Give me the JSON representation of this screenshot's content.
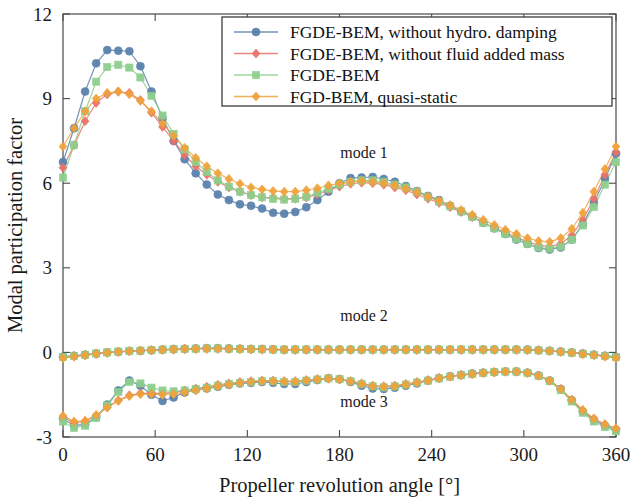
{
  "chart_data": {
    "type": "line",
    "title": "",
    "xlabel": "Propeller revolution angle [°]",
    "ylabel": "Modal participation factor",
    "xlim": [
      0,
      360
    ],
    "ylim": [
      -3,
      12
    ],
    "xticks": [
      0,
      60,
      120,
      180,
      240,
      300,
      360
    ],
    "yticks": [
      -3,
      0,
      3,
      6,
      9,
      12
    ],
    "xtick_labels": [
      "0",
      "60",
      "120",
      "180",
      "240",
      "300",
      "360"
    ],
    "ytick_labels": [
      "-3",
      "0",
      "3",
      "6",
      "9",
      "12"
    ],
    "grid": false,
    "legend_position": "top-right-inside",
    "annotations": [
      {
        "text": "mode 1",
        "x": 196,
        "y": 6.9
      },
      {
        "text": "mode 2",
        "x": 196,
        "y": 1.1
      },
      {
        "text": "mode 3",
        "x": 196,
        "y": -1.95
      }
    ],
    "x": [
      0,
      7.2,
      14.4,
      21.6,
      28.8,
      36,
      43.2,
      50.4,
      57.6,
      64.8,
      72,
      79.2,
      86.4,
      93.6,
      100.8,
      108,
      115.2,
      122.4,
      129.6,
      136.8,
      144,
      151.2,
      158.4,
      165.6,
      172.8,
      180,
      187.2,
      194.4,
      201.6,
      208.8,
      216,
      223.2,
      230.4,
      237.6,
      244.8,
      252,
      259.2,
      266.4,
      273.6,
      280.8,
      288,
      295.2,
      302.4,
      309.6,
      316.8,
      324,
      331.2,
      338.4,
      345.6,
      352.8,
      360
    ],
    "series": [
      {
        "name": "FGDE-BEM, without hydro. damping",
        "color": "#5b82ad",
        "marker": "circle",
        "mode": 1,
        "values": [
          6.75,
          7.95,
          9.25,
          10.25,
          10.72,
          10.7,
          10.68,
          10.15,
          9.25,
          8.3,
          7.5,
          6.85,
          6.35,
          5.95,
          5.6,
          5.4,
          5.25,
          5.2,
          5.1,
          4.95,
          4.92,
          4.98,
          5.15,
          5.4,
          5.7,
          6.0,
          6.18,
          6.2,
          6.22,
          6.15,
          6.05,
          5.9,
          5.72,
          5.55,
          5.4,
          5.2,
          5.0,
          4.82,
          4.6,
          4.4,
          4.2,
          4.0,
          3.85,
          3.7,
          3.65,
          3.72,
          4.0,
          4.55,
          5.3,
          6.15,
          7.05
        ]
      },
      {
        "name": "FGDE-BEM, without fluid added mass",
        "color": "#e8736a",
        "marker": "diamond",
        "mode": 1,
        "values": [
          6.55,
          7.35,
          8.2,
          8.85,
          9.15,
          9.25,
          9.2,
          8.95,
          8.5,
          8.0,
          7.5,
          7.0,
          6.6,
          6.3,
          6.05,
          5.85,
          5.7,
          5.58,
          5.5,
          5.48,
          5.45,
          5.45,
          5.5,
          5.6,
          5.75,
          5.88,
          5.98,
          6.02,
          6.0,
          5.95,
          5.85,
          5.75,
          5.6,
          5.45,
          5.3,
          5.15,
          4.98,
          4.8,
          4.6,
          4.42,
          4.25,
          4.08,
          3.92,
          3.8,
          3.75,
          3.85,
          4.15,
          4.7,
          5.45,
          6.3,
          7.1
        ]
      },
      {
        "name": "FGDE-BEM",
        "color": "#8ecf8e",
        "marker": "square",
        "mode": 1,
        "values": [
          6.2,
          7.35,
          8.55,
          9.6,
          10.12,
          10.2,
          10.1,
          9.75,
          9.1,
          8.4,
          7.75,
          7.2,
          6.75,
          6.4,
          6.1,
          5.88,
          5.7,
          5.58,
          5.5,
          5.45,
          5.42,
          5.45,
          5.52,
          5.65,
          5.8,
          5.95,
          6.05,
          6.1,
          6.1,
          6.05,
          5.95,
          5.85,
          5.7,
          5.52,
          5.35,
          5.18,
          5.0,
          4.8,
          4.6,
          4.4,
          4.2,
          4.02,
          3.85,
          3.72,
          3.68,
          3.75,
          4.0,
          4.5,
          5.15,
          5.95,
          6.75
        ]
      },
      {
        "name": "FGD-BEM, quasi-static",
        "color": "#f0a33c",
        "marker": "diamond",
        "mode": 1,
        "values": [
          7.3,
          7.95,
          8.55,
          9.0,
          9.2,
          9.25,
          9.15,
          8.92,
          8.55,
          8.12,
          7.68,
          7.25,
          6.9,
          6.6,
          6.35,
          6.15,
          5.98,
          5.85,
          5.78,
          5.72,
          5.7,
          5.7,
          5.75,
          5.82,
          5.92,
          6.0,
          6.05,
          6.08,
          6.05,
          6.0,
          5.92,
          5.8,
          5.68,
          5.52,
          5.38,
          5.22,
          5.05,
          4.88,
          4.7,
          4.52,
          4.35,
          4.2,
          4.05,
          3.95,
          3.92,
          4.05,
          4.38,
          4.95,
          5.7,
          6.5,
          7.3
        ]
      },
      {
        "name": "FGDE-BEM, without hydro. damping",
        "color": "#5b82ad",
        "marker": "circle",
        "mode": 2,
        "values": [
          -0.15,
          -0.12,
          -0.08,
          -0.04,
          0.0,
          0.02,
          0.05,
          0.06,
          0.08,
          0.1,
          0.12,
          0.13,
          0.14,
          0.15,
          0.15,
          0.14,
          0.13,
          0.12,
          0.12,
          0.11,
          0.1,
          0.1,
          0.1,
          0.1,
          0.1,
          0.1,
          0.1,
          0.1,
          0.1,
          0.1,
          0.1,
          0.1,
          0.1,
          0.1,
          0.1,
          0.1,
          0.1,
          0.1,
          0.1,
          0.1,
          0.1,
          0.1,
          0.1,
          0.08,
          0.06,
          0.03,
          0.0,
          -0.04,
          -0.08,
          -0.12,
          -0.16
        ]
      },
      {
        "name": "FGDE-BEM, without fluid added mass",
        "color": "#e8736a",
        "marker": "diamond",
        "mode": 2,
        "values": [
          -0.18,
          -0.14,
          -0.1,
          -0.05,
          -0.01,
          0.02,
          0.04,
          0.06,
          0.07,
          0.09,
          0.1,
          0.11,
          0.12,
          0.13,
          0.13,
          0.12,
          0.12,
          0.11,
          0.1,
          0.1,
          0.09,
          0.09,
          0.09,
          0.09,
          0.09,
          0.09,
          0.09,
          0.09,
          0.09,
          0.09,
          0.09,
          0.09,
          0.09,
          0.09,
          0.09,
          0.09,
          0.09,
          0.09,
          0.09,
          0.09,
          0.09,
          0.09,
          0.08,
          0.07,
          0.05,
          0.02,
          -0.01,
          -0.05,
          -0.09,
          -0.13,
          -0.18
        ]
      },
      {
        "name": "FGDE-BEM",
        "color": "#8ecf8e",
        "marker": "square",
        "mode": 2,
        "values": [
          -0.16,
          -0.13,
          -0.09,
          -0.04,
          0.0,
          0.03,
          0.05,
          0.06,
          0.08,
          0.1,
          0.11,
          0.12,
          0.13,
          0.14,
          0.14,
          0.13,
          0.12,
          0.12,
          0.11,
          0.1,
          0.1,
          0.1,
          0.1,
          0.1,
          0.1,
          0.1,
          0.1,
          0.1,
          0.1,
          0.1,
          0.1,
          0.1,
          0.1,
          0.1,
          0.1,
          0.1,
          0.1,
          0.1,
          0.1,
          0.1,
          0.1,
          0.1,
          0.09,
          0.07,
          0.05,
          0.02,
          -0.01,
          -0.05,
          -0.09,
          -0.13,
          -0.17
        ]
      },
      {
        "name": "FGD-BEM, quasi-static",
        "color": "#f0a33c",
        "marker": "diamond",
        "mode": 2,
        "values": [
          -0.2,
          -0.15,
          -0.1,
          -0.05,
          -0.01,
          0.02,
          0.04,
          0.06,
          0.08,
          0.09,
          0.11,
          0.12,
          0.13,
          0.13,
          0.13,
          0.13,
          0.12,
          0.11,
          0.11,
          0.1,
          0.1,
          0.1,
          0.1,
          0.1,
          0.1,
          0.1,
          0.1,
          0.1,
          0.1,
          0.1,
          0.1,
          0.1,
          0.1,
          0.1,
          0.1,
          0.1,
          0.1,
          0.1,
          0.1,
          0.1,
          0.1,
          0.1,
          0.09,
          0.07,
          0.05,
          0.02,
          -0.01,
          -0.06,
          -0.1,
          -0.15,
          -0.2
        ]
      },
      {
        "name": "FGDE-BEM, without hydro. damping",
        "color": "#5b82ad",
        "marker": "circle",
        "mode": 3,
        "values": [
          -2.35,
          -2.6,
          -2.55,
          -2.3,
          -1.85,
          -1.35,
          -1.0,
          -1.18,
          -1.5,
          -1.72,
          -1.6,
          -1.42,
          -1.32,
          -1.28,
          -1.22,
          -1.15,
          -1.1,
          -1.08,
          -1.05,
          -1.08,
          -1.12,
          -1.12,
          -1.05,
          -0.98,
          -0.92,
          -0.95,
          -1.05,
          -1.18,
          -1.28,
          -1.3,
          -1.25,
          -1.18,
          -1.1,
          -1.0,
          -0.92,
          -0.85,
          -0.8,
          -0.75,
          -0.72,
          -0.7,
          -0.68,
          -0.68,
          -0.72,
          -0.82,
          -1.0,
          -1.3,
          -1.7,
          -2.1,
          -2.4,
          -2.6,
          -2.75
        ]
      },
      {
        "name": "FGDE-BEM, without fluid added mass",
        "color": "#e8736a",
        "marker": "diamond",
        "mode": 3,
        "values": [
          -2.3,
          -2.5,
          -2.45,
          -2.25,
          -1.95,
          -1.7,
          -1.52,
          -1.45,
          -1.45,
          -1.45,
          -1.42,
          -1.35,
          -1.28,
          -1.22,
          -1.15,
          -1.1,
          -1.05,
          -1.02,
          -1.0,
          -1.0,
          -1.02,
          -1.02,
          -0.98,
          -0.95,
          -0.92,
          -0.95,
          -1.02,
          -1.1,
          -1.18,
          -1.2,
          -1.18,
          -1.12,
          -1.05,
          -0.98,
          -0.9,
          -0.85,
          -0.8,
          -0.76,
          -0.72,
          -0.7,
          -0.68,
          -0.68,
          -0.72,
          -0.82,
          -1.0,
          -1.3,
          -1.68,
          -2.05,
          -2.35,
          -2.55,
          -2.7
        ]
      },
      {
        "name": "FGDE-BEM",
        "color": "#8ecf8e",
        "marker": "square",
        "mode": 3,
        "values": [
          -2.45,
          -2.68,
          -2.6,
          -2.32,
          -1.88,
          -1.4,
          -1.05,
          -1.1,
          -1.25,
          -1.35,
          -1.38,
          -1.35,
          -1.3,
          -1.25,
          -1.18,
          -1.12,
          -1.08,
          -1.05,
          -1.02,
          -1.02,
          -1.05,
          -1.05,
          -1.0,
          -0.96,
          -0.92,
          -0.95,
          -1.02,
          -1.12,
          -1.2,
          -1.24,
          -1.2,
          -1.14,
          -1.07,
          -1.0,
          -0.92,
          -0.86,
          -0.81,
          -0.77,
          -0.73,
          -0.7,
          -0.68,
          -0.68,
          -0.73,
          -0.84,
          -1.02,
          -1.34,
          -1.74,
          -2.14,
          -2.45,
          -2.65,
          -2.8
        ]
      },
      {
        "name": "FGD-BEM, quasi-static",
        "color": "#f0a33c",
        "marker": "diamond",
        "mode": 3,
        "values": [
          -2.25,
          -2.45,
          -2.42,
          -2.22,
          -1.95,
          -1.72,
          -1.55,
          -1.48,
          -1.48,
          -1.5,
          -1.48,
          -1.42,
          -1.35,
          -1.28,
          -1.2,
          -1.14,
          -1.08,
          -1.04,
          -1.02,
          -1.02,
          -1.04,
          -1.04,
          -1.0,
          -0.96,
          -0.93,
          -0.96,
          -1.03,
          -1.12,
          -1.2,
          -1.22,
          -1.2,
          -1.14,
          -1.07,
          -1.0,
          -0.92,
          -0.86,
          -0.81,
          -0.77,
          -0.73,
          -0.7,
          -0.68,
          -0.68,
          -0.73,
          -0.83,
          -1.0,
          -1.3,
          -1.68,
          -2.05,
          -2.35,
          -2.55,
          -2.7
        ]
      }
    ],
    "legend": [
      {
        "label": "FGDE-BEM, without hydro. damping",
        "color": "#5b82ad",
        "marker": "circle"
      },
      {
        "label": "FGDE-BEM, without fluid added mass",
        "color": "#e8736a",
        "marker": "diamond"
      },
      {
        "label": "FGDE-BEM",
        "color": "#8ecf8e",
        "marker": "square"
      },
      {
        "label": "FGD-BEM, quasi-static",
        "color": "#f0a33c",
        "marker": "diamond"
      }
    ]
  }
}
